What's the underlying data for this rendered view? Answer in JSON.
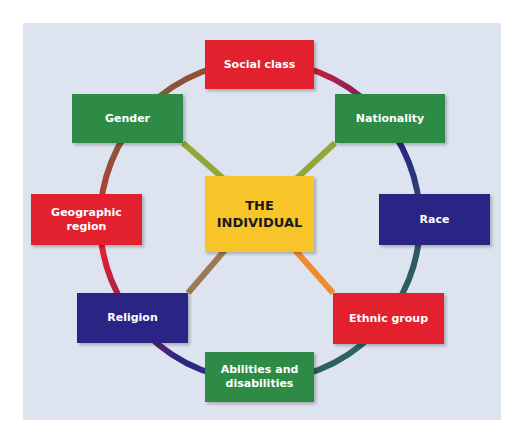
{
  "center": {
    "line1": "THE",
    "line2": "INDIVIDUAL",
    "color": "#f7c42a"
  },
  "nodes": [
    {
      "id": "social-class",
      "label": "Social class",
      "color": "#e3202e"
    },
    {
      "id": "nationality",
      "label": "Nationality",
      "color": "#2e8b45"
    },
    {
      "id": "race",
      "label": "Race",
      "color": "#2a2585"
    },
    {
      "id": "ethnic-group",
      "label": "Ethnic group",
      "color": "#e3202e"
    },
    {
      "id": "abilities",
      "label1": "Abilities and",
      "label2": "disabilities",
      "color": "#2e8b45"
    },
    {
      "id": "religion",
      "label": "Religion",
      "color": "#2a2585"
    },
    {
      "id": "geographic-region",
      "label": "Geographic region",
      "color": "#e3202e"
    },
    {
      "id": "gender",
      "label": "Gender",
      "color": "#2e8b45"
    }
  ]
}
